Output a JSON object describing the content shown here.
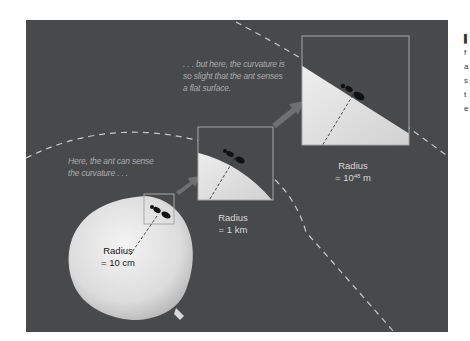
{
  "figure": {
    "background_color": "#48494b",
    "captions": {
      "near": {
        "line1": "Here, the ant can sense",
        "line2": "the curvature . . ."
      },
      "far": {
        "line1": ". . . but here, the curvature is",
        "line2": "so slight that the ant senses",
        "line3": "a flat surface."
      }
    },
    "panels": [
      {
        "name": "balloon",
        "label_line1": "Radius",
        "label_line2": "= 10 cm"
      },
      {
        "name": "one-km",
        "label_line1": "Radius",
        "label_line2": "= 1 km"
      },
      {
        "name": "huge",
        "label_line1": "Radius",
        "label_line2_prefix": "= 10",
        "label_line2_exp": "48",
        "label_line2_suffix": " m"
      }
    ]
  },
  "sidebar_fragment": {
    "letters": [
      "f",
      "a",
      "s",
      "t",
      "e"
    ]
  }
}
